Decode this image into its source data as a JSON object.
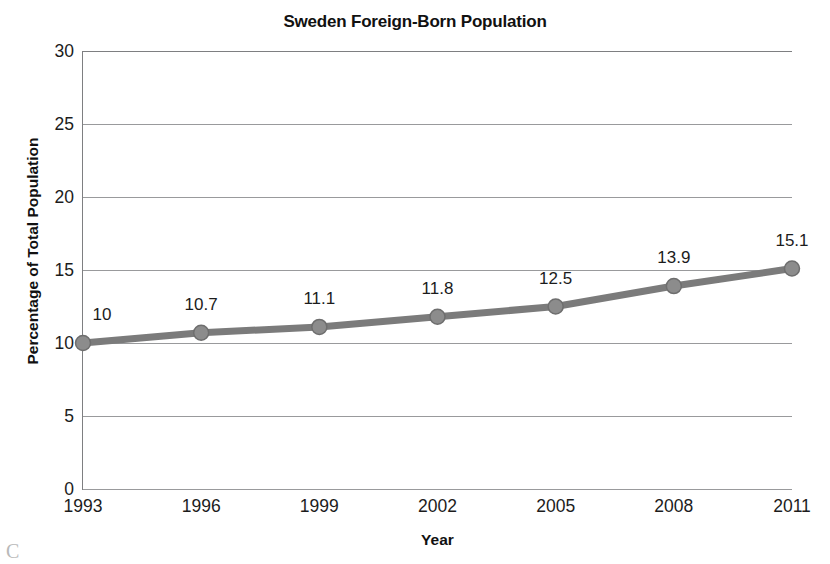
{
  "chart_data": {
    "type": "line",
    "title": "Sweden Foreign-Born Population",
    "xlabel": "Year",
    "ylabel": "Percentage of Total Population",
    "categories": [
      "1993",
      "1996",
      "1999",
      "2002",
      "2005",
      "2008",
      "2011"
    ],
    "x": [
      1993,
      1996,
      1999,
      2002,
      2005,
      2008,
      2011
    ],
    "values": [
      10,
      10.7,
      11.1,
      11.8,
      12.5,
      13.9,
      15.1
    ],
    "point_labels": [
      "10",
      "10.7",
      "11.1",
      "11.8",
      "12.5",
      "13.9",
      "15.1"
    ],
    "ylim": [
      0,
      30
    ],
    "yticks": [
      0,
      5,
      10,
      15,
      20,
      25,
      30
    ],
    "ytick_labels": [
      "0",
      "5",
      "10",
      "15",
      "20",
      "25",
      "30"
    ],
    "grid": true,
    "grid_axis": "y",
    "legend": false,
    "series": [
      {
        "name": "Percentage of Total Population",
        "values": [
          10,
          10.7,
          11.1,
          11.8,
          12.5,
          13.9,
          15.1
        ]
      }
    ],
    "colors": {
      "line": "#7b7b7b",
      "marker_fill": "#8c8c8c",
      "marker_stroke": "#6e6e6e",
      "gridline": "#999a9c",
      "axis": "#7e7f81",
      "text": "#1c1c1c",
      "background": "#ffffff"
    }
  },
  "artifact": {
    "bottom_left_glyph": "C"
  }
}
